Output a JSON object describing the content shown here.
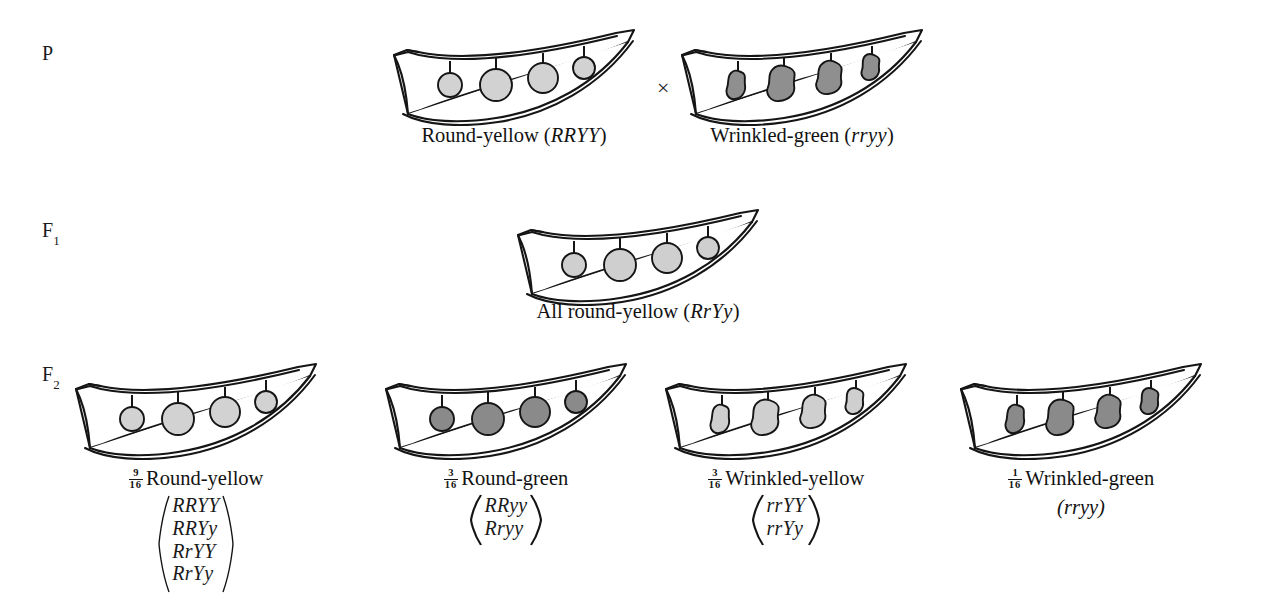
{
  "figure": {
    "cross_symbol": "×"
  },
  "generations": [
    {
      "label": "P",
      "sub": ""
    },
    {
      "label": "F",
      "sub": "1"
    },
    {
      "label": "F",
      "sub": "2"
    }
  ],
  "parents": [
    {
      "name": "round-yellow-parent",
      "phenotype": "Round-yellow",
      "genotype": "RRYY",
      "caption_prefix": "Round-yellow (",
      "caption_suffix": ")",
      "pea_shape": "round",
      "pea_color": "#d2d2d2"
    },
    {
      "name": "wrinkled-green-parent",
      "phenotype": "Wrinkled-green",
      "genotype": "rryy",
      "caption_prefix": "Wrinkled-green (",
      "caption_suffix": ")",
      "pea_shape": "wrinkled",
      "pea_color": "#8f8f8f"
    }
  ],
  "f1": {
    "name": "f1-round-yellow",
    "caption_prefix": "All round-yellow (",
    "genotype": "RrYy",
    "caption_suffix": ")",
    "pea_shape": "round",
    "pea_color": "#cfcfcf"
  },
  "f2": [
    {
      "name": "f2-round-yellow",
      "fraction_num": "9",
      "fraction_den": "16",
      "phenotype": "Round-yellow",
      "genotypes": [
        "RRYY",
        "RRYy",
        "RrYY",
        "RrYy"
      ],
      "pea_shape": "round",
      "pea_color": "#d2d2d2"
    },
    {
      "name": "f2-round-green",
      "fraction_num": "3",
      "fraction_den": "16",
      "phenotype": "Round-green",
      "genotypes": [
        "RRyy",
        "Rryy"
      ],
      "pea_shape": "round",
      "pea_color": "#8a8a8a"
    },
    {
      "name": "f2-wrinkled-yellow",
      "fraction_num": "3",
      "fraction_den": "16",
      "phenotype": "Wrinkled-yellow",
      "genotypes": [
        "rrYY",
        "rrYy"
      ],
      "pea_shape": "wrinkled",
      "pea_color": "#cfcfcf"
    },
    {
      "name": "f2-wrinkled-green",
      "fraction_num": "1",
      "fraction_den": "16",
      "phenotype": "Wrinkled-green",
      "genotypes": [
        "rryy"
      ],
      "pea_shape": "wrinkled",
      "pea_color": "#8a8a8a"
    }
  ],
  "colors": {
    "ink": "#151515",
    "pea_light": "#d2d2d2",
    "pea_dark": "#8a8a8a",
    "background": "#ffffff"
  }
}
